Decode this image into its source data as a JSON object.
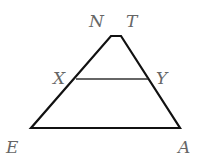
{
  "diagram": {
    "type": "trapezoid-with-segment",
    "stroke_color": "#111111",
    "label_color": "#666666",
    "vertices": {
      "N": {
        "label": "N",
        "x": 111,
        "y": 36
      },
      "T": {
        "label": "T",
        "x": 121,
        "y": 36
      },
      "A": {
        "label": "A",
        "x": 180,
        "y": 128
      },
      "E": {
        "label": "E",
        "x": 31,
        "y": 128
      },
      "X": {
        "label": "X",
        "x": 76,
        "y": 79
      },
      "Y": {
        "label": "Y",
        "x": 148,
        "y": 79
      }
    },
    "labels": {
      "N": "N",
      "T": "T",
      "X": "X",
      "Y": "Y",
      "E": "E",
      "A": "A"
    },
    "segments": [
      {
        "from": "N",
        "to": "T"
      },
      {
        "from": "T",
        "to": "A"
      },
      {
        "from": "A",
        "to": "E"
      },
      {
        "from": "E",
        "to": "N"
      },
      {
        "from": "X",
        "to": "Y"
      }
    ]
  }
}
